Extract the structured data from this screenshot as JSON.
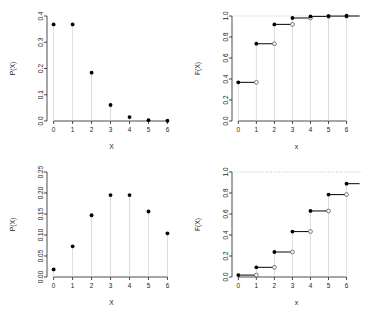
{
  "figure": {
    "title": "",
    "background_color": "#ffffff",
    "layout": "2x2 panel grid",
    "panel_count": 4
  },
  "chart_data": [
    {
      "type": "scatter",
      "panel": "top-left",
      "title": "",
      "subtitle": "",
      "xlabel": "X",
      "ylabel": "P(X)",
      "x": [
        0,
        1,
        2,
        3,
        4,
        5,
        6
      ],
      "values": [
        0.368,
        0.368,
        0.184,
        0.061,
        0.015,
        0.003,
        0.001
      ],
      "xticks": [
        0,
        1,
        2,
        3,
        4,
        5,
        6
      ],
      "xtick_labels": [
        "0",
        "1",
        "2",
        "3",
        "4",
        "5",
        "6"
      ],
      "yticks": [
        0.0,
        0.1,
        0.2,
        0.3,
        0.4
      ],
      "ytick_labels": [
        "0.0",
        "0.1",
        "0.2",
        "0.3",
        "0.4"
      ],
      "xlim": [
        -0.35,
        6.45
      ],
      "ylim": [
        0.0,
        0.4
      ],
      "grid": false,
      "legend": "none",
      "marker": "filled-circle",
      "stems": true,
      "stem_color": "#cfcfcf",
      "point_color": "#000000",
      "description": "Poisson probability mass function, lambda = 1"
    },
    {
      "type": "line",
      "panel": "top-right",
      "title": "",
      "subtitle": "",
      "xlabel": "x",
      "ylabel": "F(X)",
      "x": [
        0,
        1,
        2,
        3,
        4,
        5,
        6
      ],
      "values": [
        0.368,
        0.736,
        0.92,
        0.981,
        0.996,
        0.999,
        1.0
      ],
      "xticks": [
        0,
        1,
        2,
        3,
        4,
        5,
        6
      ],
      "xtick_labels": [
        "0",
        "1",
        "2",
        "3",
        "4",
        "5",
        "6"
      ],
      "yticks": [
        0.0,
        0.2,
        0.4,
        0.6,
        0.8,
        1.0
      ],
      "ytick_labels": [
        "0.0",
        "0.2",
        "0.4",
        "0.6",
        "0.8",
        "1.0"
      ],
      "xlim": [
        -0.35,
        6.8
      ],
      "ylim": [
        0.0,
        1.0
      ],
      "grid": false,
      "legend": "none",
      "step": true,
      "marker_left": "filled-circle",
      "marker_right": "open-circle",
      "reference_line_y": 1.0,
      "reference_line_style": "dotted",
      "description": "Poisson cumulative distribution function, lambda = 1"
    },
    {
      "type": "scatter",
      "panel": "bottom-left",
      "title": "",
      "subtitle": "",
      "xlabel": "X",
      "ylabel": "P(X)",
      "x": [
        0,
        1,
        2,
        3,
        4,
        5,
        6
      ],
      "values": [
        0.018,
        0.073,
        0.147,
        0.195,
        0.195,
        0.156,
        0.104
      ],
      "xticks": [
        0,
        1,
        2,
        3,
        4,
        5,
        6
      ],
      "xtick_labels": [
        "0",
        "1",
        "2",
        "3",
        "4",
        "5",
        "6"
      ],
      "yticks": [
        0.0,
        0.05,
        0.1,
        0.15,
        0.2,
        0.25
      ],
      "ytick_labels": [
        "0.00",
        "0.05",
        "0.10",
        "0.15",
        "0.20",
        "0.25"
      ],
      "xlim": [
        -0.35,
        6.45
      ],
      "ylim": [
        0.0,
        0.25
      ],
      "grid": false,
      "legend": "none",
      "marker": "filled-circle",
      "stems": true,
      "stem_color": "#cfcfcf",
      "point_color": "#000000",
      "description": "Poisson probability mass function, lambda = 4"
    },
    {
      "type": "line",
      "panel": "bottom-right",
      "title": "",
      "subtitle": "",
      "xlabel": "x",
      "ylabel": "F(X)",
      "x": [
        0,
        1,
        2,
        3,
        4,
        5,
        6
      ],
      "values": [
        0.018,
        0.092,
        0.238,
        0.433,
        0.629,
        0.785,
        0.889
      ],
      "xticks": [
        0,
        1,
        2,
        3,
        4,
        5,
        6
      ],
      "xtick_labels": [
        "0",
        "1",
        "2",
        "3",
        "4",
        "5",
        "6"
      ],
      "yticks": [
        0.0,
        0.2,
        0.4,
        0.6,
        0.8,
        1.0
      ],
      "ytick_labels": [
        "0.0",
        "0.2",
        "0.4",
        "0.6",
        "0.8",
        "1.0"
      ],
      "xlim": [
        -0.35,
        6.8
      ],
      "ylim": [
        0.0,
        1.0
      ],
      "grid": false,
      "legend": "none",
      "step": true,
      "marker_left": "filled-circle",
      "marker_right": "open-circle",
      "reference_line_y": 1.0,
      "reference_line_style": "dotted",
      "description": "Poisson cumulative distribution function, lambda = 4"
    }
  ],
  "colors": {
    "point": "#000000",
    "stem": "#cfcfcf",
    "axis": "#000000",
    "step": "#1a1a1a",
    "reference": "#9a9a9a",
    "open_marker_fill": "#ffffff",
    "open_marker_stroke": "#555555"
  }
}
